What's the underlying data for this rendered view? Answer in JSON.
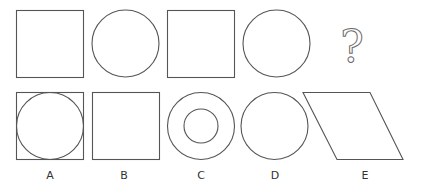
{
  "puzzle": {
    "sequence": [
      {
        "shape": "square"
      },
      {
        "shape": "circle"
      },
      {
        "shape": "square"
      },
      {
        "shape": "circle"
      },
      {
        "shape": "question-mark",
        "text": "?"
      }
    ],
    "options": [
      {
        "label": "A",
        "shape": "square with inscribed circle"
      },
      {
        "label": "B",
        "shape": "square"
      },
      {
        "label": "C",
        "shape": "concentric circles"
      },
      {
        "label": "D",
        "shape": "circle"
      },
      {
        "label": "E",
        "shape": "parallelogram"
      }
    ]
  },
  "colors": {
    "stroke": "#555555",
    "background": "#ffffff"
  }
}
